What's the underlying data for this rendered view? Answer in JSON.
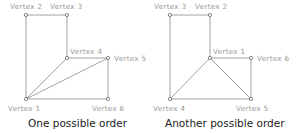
{
  "diagrams": [
    {
      "caption": "One possible order",
      "vertices": [
        {
          "label": "Vertex 1",
          "x": 26,
          "y": 99,
          "lx": 8,
          "ly": 111
        },
        {
          "label": "Vertex 2",
          "x": 26,
          "y": 15,
          "lx": 10,
          "ly": 9
        },
        {
          "label": "Vertex 3",
          "x": 67,
          "y": 15,
          "lx": 50,
          "ly": 9
        },
        {
          "label": "Vertex 4",
          "x": 67,
          "y": 58,
          "lx": 70,
          "ly": 54
        },
        {
          "label": "Vertex 5",
          "x": 108,
          "y": 58,
          "lx": 114,
          "ly": 61
        },
        {
          "label": "Vertex 6",
          "x": 108,
          "y": 99,
          "lx": 92,
          "ly": 111
        }
      ],
      "edges": [
        [
          1,
          2
        ],
        [
          2,
          3
        ],
        [
          3,
          4
        ],
        [
          4,
          5
        ],
        [
          5,
          6
        ],
        [
          6,
          1
        ],
        [
          1,
          4
        ],
        [
          1,
          5
        ]
      ]
    },
    {
      "caption": "Another possible order",
      "vertices": [
        {
          "label": "Vertex 1",
          "x": 210,
          "y": 58,
          "lx": 213,
          "ly": 54
        },
        {
          "label": "Vertex 2",
          "x": 210,
          "y": 15,
          "lx": 195,
          "ly": 9
        },
        {
          "label": "Vertex 3",
          "x": 170,
          "y": 15,
          "lx": 154,
          "ly": 9
        },
        {
          "label": "Vertex 4",
          "x": 170,
          "y": 99,
          "lx": 153,
          "ly": 111
        },
        {
          "label": "Vertex 5",
          "x": 251,
          "y": 99,
          "lx": 236,
          "ly": 111
        },
        {
          "label": "Vertex 6",
          "x": 251,
          "y": 58,
          "lx": 257,
          "ly": 61
        }
      ],
      "edges": [
        [
          3,
          2
        ],
        [
          2,
          1
        ],
        [
          1,
          6
        ],
        [
          6,
          5
        ],
        [
          5,
          4
        ],
        [
          4,
          3
        ],
        [
          1,
          4
        ],
        [
          1,
          5
        ]
      ]
    }
  ],
  "captions": {
    "left": "One possible order",
    "right": "Another possible order"
  }
}
